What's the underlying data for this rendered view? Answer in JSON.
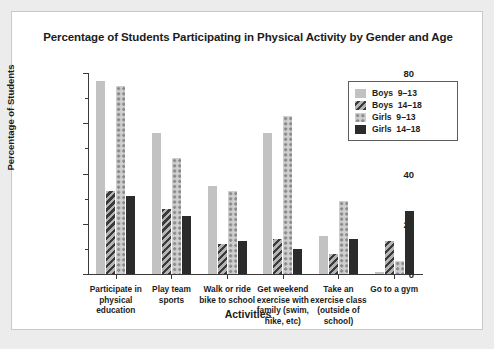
{
  "chart_data": {
    "type": "bar",
    "title": "Percentage of Students Participating in Physical Activity by Gender and Age",
    "xlabel": "Activities",
    "ylabel": "Percentage of Students",
    "ylim": [
      0,
      80
    ],
    "yticks": [
      0,
      20,
      40,
      60,
      80
    ],
    "yticks_minor": [
      10,
      30,
      50,
      70
    ],
    "grid": false,
    "legend_position": "top-right",
    "categories": [
      "Participate in\nphysical\neducation",
      "Play team\nsports",
      "Walk or ride\nbike to school",
      "Get weekend\nexercise with\nfamily (swim,\nhike, etc)",
      "Take an\nexercise class\n(outside of\nschool)",
      "Go to a gym"
    ],
    "series": [
      {
        "name": "Boys  9–13",
        "key": "boys913",
        "color": "#c2c2c2",
        "pattern": "solid-light",
        "values": [
          77,
          56,
          35,
          56,
          15,
          1
        ]
      },
      {
        "name": "Boys  14–18",
        "key": "boys1418",
        "color": "#3a3a3a",
        "pattern": "diagonal-stripe",
        "values": [
          33,
          26,
          12,
          14,
          8,
          13
        ]
      },
      {
        "name": "Girls  9–13",
        "key": "girls913",
        "color": "#cfcfcf",
        "pattern": "dotted",
        "values": [
          75,
          46,
          33,
          63,
          29,
          5
        ]
      },
      {
        "name": "Girls  14–18",
        "key": "girls1418",
        "color": "#2b2b2b",
        "pattern": "solid-dark",
        "values": [
          31,
          23,
          13,
          10,
          14,
          25
        ]
      }
    ]
  },
  "legend": {
    "items": [
      {
        "label": "Boys  9–13",
        "swatch": "boys913"
      },
      {
        "label": "Boys  14–18",
        "swatch": "boys1418"
      },
      {
        "label": "Girls  9–13",
        "swatch": "girls913"
      },
      {
        "label": "Girls  14–18",
        "swatch": "girls1418"
      }
    ]
  },
  "colors": {
    "card_background": "#ffffff",
    "page_background": "#ececed",
    "axis": "#3a3a3a",
    "text": "#1c1c1c",
    "border": "#c9c9c9"
  }
}
